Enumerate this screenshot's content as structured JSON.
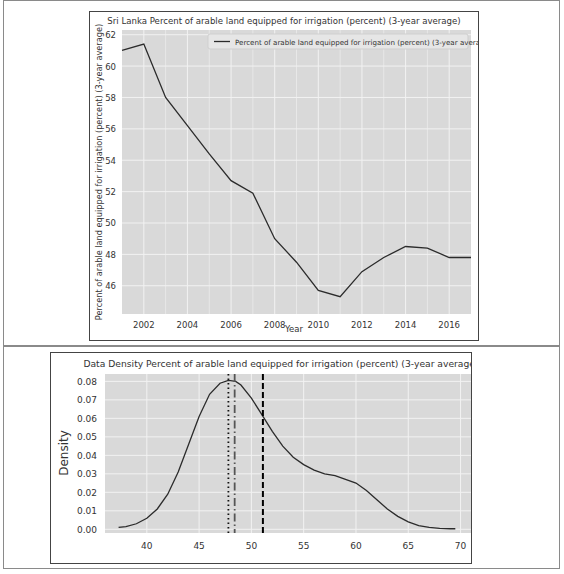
{
  "chart_data": [
    {
      "type": "line",
      "title": "Sri Lanka Percent of arable land equipped for irrigation (percent) (3-year average)",
      "xlabel": "Year",
      "ylabel": "Percent of arable land equipped for irrigation (percent) (3-year average)",
      "legend": [
        "Percent of arable land equipped for irrigation (percent) (3-year average)"
      ],
      "legend_position": "upper right",
      "grid": true,
      "xlim": [
        2001,
        2017
      ],
      "ylim": [
        44.2,
        62.3
      ],
      "x_ticks": [
        "2002",
        "2004",
        "2006",
        "2008",
        "2010",
        "2012",
        "2014",
        "2016"
      ],
      "y_ticks": [
        "46",
        "48",
        "50",
        "52",
        "54",
        "56",
        "58",
        "60",
        "62"
      ],
      "x": [
        2001,
        2002,
        2003,
        2004,
        2005,
        2006,
        2007,
        2008,
        2009,
        2010,
        2011,
        2012,
        2013,
        2014,
        2015,
        2016,
        2017
      ],
      "series": [
        {
          "name": "Percent of arable land equipped for irrigation (percent) (3-year average)",
          "values": [
            61.0,
            61.4,
            58.0,
            56.2,
            54.4,
            52.7,
            51.9,
            49.0,
            47.5,
            45.7,
            45.3,
            46.9,
            47.8,
            48.5,
            48.4,
            47.8,
            47.8
          ]
        }
      ]
    },
    {
      "type": "line",
      "title": "Data Density Percent of arable land equipped for irrigation (percent) (3-year average)",
      "xlabel": "",
      "ylabel": "Density",
      "grid": true,
      "xlim": [
        36,
        71
      ],
      "ylim": [
        -0.002,
        0.084
      ],
      "x_ticks": [
        "40",
        "45",
        "50",
        "55",
        "60",
        "65",
        "70"
      ],
      "y_ticks": [
        "0.00",
        "0.01",
        "0.02",
        "0.03",
        "0.04",
        "0.05",
        "0.06",
        "0.07",
        "0.08"
      ],
      "x": [
        37.3,
        38,
        39,
        40,
        41,
        42,
        43,
        44,
        45,
        46,
        47,
        47.8,
        48.5,
        49,
        50,
        51,
        52,
        53,
        54,
        55,
        56,
        57,
        58,
        59,
        60,
        61,
        62,
        63,
        64,
        65,
        66,
        67,
        68,
        69,
        69.5
      ],
      "series": [
        {
          "name": "density",
          "values": [
            0.001,
            0.0015,
            0.003,
            0.006,
            0.011,
            0.019,
            0.031,
            0.046,
            0.061,
            0.073,
            0.079,
            0.0805,
            0.08,
            0.078,
            0.071,
            0.062,
            0.053,
            0.045,
            0.039,
            0.035,
            0.032,
            0.03,
            0.029,
            0.027,
            0.025,
            0.021,
            0.016,
            0.011,
            0.007,
            0.004,
            0.002,
            0.001,
            0.0005,
            0.0003,
            0.0003
          ]
        }
      ],
      "vertical_lines": [
        {
          "style": "dotted",
          "x": 47.8,
          "label": "median"
        },
        {
          "style": "dashdot",
          "x": 48.4,
          "label": "mode"
        },
        {
          "style": "dashed",
          "x": 51.1,
          "label": "mean"
        }
      ]
    }
  ],
  "top_chart": {
    "title": "Sri Lanka Percent of arable land equipped for irrigation (percent) (3-year average)",
    "xlabel": "Year",
    "ylabel": "Percent of arable land equipped for irrigation (percent) (3-year average)",
    "legend_label": "Percent of arable land equipped for irrigation (percent) (3-year average)"
  },
  "bottom_chart": {
    "title": "Data Density Percent of arable land equipped for irrigation (percent) (3-year average)",
    "ylabel": "Density"
  },
  "colors": {
    "plot_bg": "#d9d9d9",
    "grid": "#f2f2f2",
    "line": "#2b2b2b"
  }
}
